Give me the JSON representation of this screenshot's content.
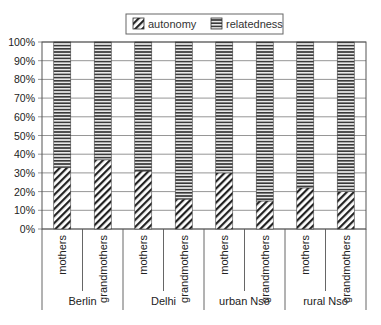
{
  "chart_data": {
    "type": "bar",
    "stacked": true,
    "percent": true,
    "title": "",
    "xlabel": "",
    "ylabel": "",
    "ylim": [
      0,
      100
    ],
    "y_ticks": [
      "0%",
      "10%",
      "20%",
      "30%",
      "40%",
      "50%",
      "60%",
      "70%",
      "80%",
      "90%",
      "100%"
    ],
    "grid": true,
    "legend_position": "top",
    "groups": [
      "Berlin",
      "Delhi",
      "urban Nso",
      "rural Nso"
    ],
    "categories": [
      "mothers",
      "grandmothers",
      "mothers",
      "grandmothers",
      "mothers",
      "grandmothers",
      "mothers",
      "grandmothers"
    ],
    "category_group": [
      "Berlin",
      "Berlin",
      "Delhi",
      "Delhi",
      "urban Nso",
      "urban Nso",
      "rural Nso",
      "rural Nso"
    ],
    "series": [
      {
        "name": "autonomy",
        "pattern": "diagonal-hatch",
        "values": [
          33,
          37,
          31,
          16,
          30,
          15,
          22,
          20
        ]
      },
      {
        "name": "relatedness",
        "pattern": "horizontal-stripes",
        "values": [
          67,
          63,
          69,
          84,
          70,
          85,
          78,
          80
        ]
      }
    ]
  },
  "legend": {
    "items": [
      {
        "label": "autonomy",
        "pattern": "diagonal-hatch"
      },
      {
        "label": "relatedness",
        "pattern": "horizontal-stripes"
      }
    ]
  },
  "colors": {
    "line": "#555555",
    "grid": "#8a8a8a",
    "stripe": "#333333",
    "text": "#222222"
  }
}
